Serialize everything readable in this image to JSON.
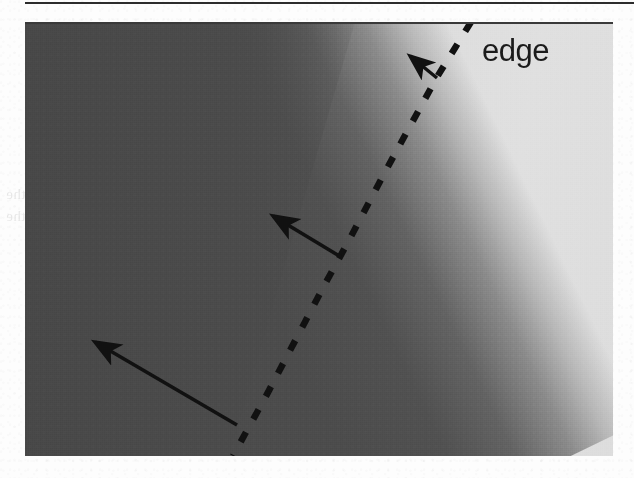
{
  "page": {
    "background_color": "#fdfdfd",
    "width": 634,
    "height": 478,
    "top_rule": {
      "color": "#2c2c2c"
    }
  },
  "figure": {
    "kind": "scanned-grayscale-photo",
    "caption_label": "edge",
    "dark_region_color": "#4b4b4b",
    "bright_region_color": "#dedede",
    "border_color": "#3a3a3a",
    "dashed_line_color": "#111111",
    "arrow_color": "#111111"
  },
  "annotations": {
    "edge_label": "edge",
    "dashed_edge": {
      "name": "edge",
      "points": "446,0 430,26 412,55 395,86 378,117 360,150 341,186 322,222 300,262 280,300 260,338 240,376 220,412 208,434"
    },
    "arrows": [
      {
        "name": "gradient-arrow-top",
        "x1": 412,
        "y1": 56,
        "x2": 385,
        "y2": 34
      },
      {
        "name": "gradient-arrow-middle",
        "x1": 316,
        "y1": 235,
        "x2": 248,
        "y2": 194
      },
      {
        "name": "gradient-arrow-bottom",
        "x1": 212,
        "y1": 403,
        "x2": 70,
        "y2": 320
      }
    ]
  },
  "show_through_text": {
    "line_a": "illustrates the",
    "line_b": "most often cannot be",
    "line_c": "the image itself",
    "line_d": "Canny kernels for edge detection",
    "line_e": "and Figure 2.20 shows the",
    "line_f": "of the",
    "line_g": "in the"
  }
}
